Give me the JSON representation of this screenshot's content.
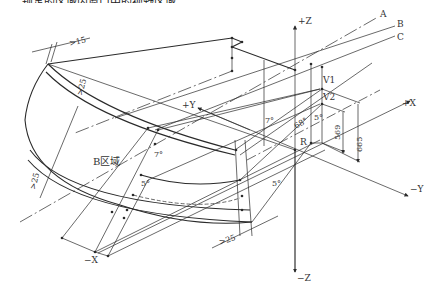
{
  "caption_top_partial": "……规定的区域内窗口中的视野区域……",
  "labels": {
    "plus_z": "+Z",
    "minus_z": "−Z",
    "plus_x": "+X",
    "minus_x": "−X",
    "plus_y": "+Y",
    "minus_y": "−Y",
    "line_a": "A",
    "line_b": "B",
    "line_c": "C",
    "v1": "V1",
    "v2": "V2",
    "r": "R",
    "zone_b": "B区域"
  },
  "dimensions": {
    "top_edge": ">15",
    "upper_band": ">25",
    "left_edge": ">25",
    "bottom_right": ">25",
    "height_569": "569",
    "height_665": "665",
    "angle_68": "68°",
    "angle_7_upper": "7°",
    "angle_7_lower": "7°",
    "angle_5_left": "5°",
    "angle_5_right": "5°",
    "angle_5_v2": "5°"
  },
  "colors": {
    "line": "#2a2a2a",
    "text": "#333333",
    "background": "#ffffff"
  }
}
